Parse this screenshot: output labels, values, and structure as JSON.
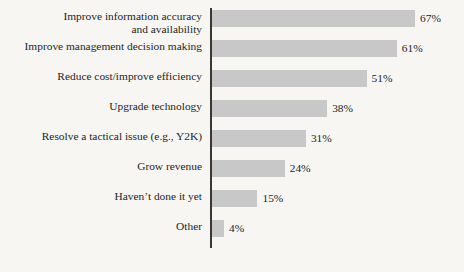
{
  "chart_data": {
    "type": "bar",
    "orientation": "horizontal",
    "title": "",
    "subtitle": "",
    "xlabel": "",
    "ylabel": "",
    "xlim": [
      0,
      70
    ],
    "grid": false,
    "legend": null,
    "value_suffix": "%",
    "bar_color": "#c8c8c8",
    "axis_color": "#3a3733",
    "background_color": "#f7f6f3",
    "text_color": "#231f1c",
    "categories": [
      "Improve information accuracy\nand availability",
      "Improve management decision making",
      "Reduce cost/improve efficiency",
      "Upgrade technology",
      "Resolve a tactical issue (e.g., Y2K)",
      "Grow revenue",
      "Haven’t done it yet",
      "Other"
    ],
    "values": [
      67,
      61,
      51,
      38,
      31,
      24,
      15,
      4
    ],
    "value_labels": [
      "67%",
      "61%",
      "51%",
      "38%",
      "31%",
      "24%",
      "15%",
      "4%"
    ]
  }
}
